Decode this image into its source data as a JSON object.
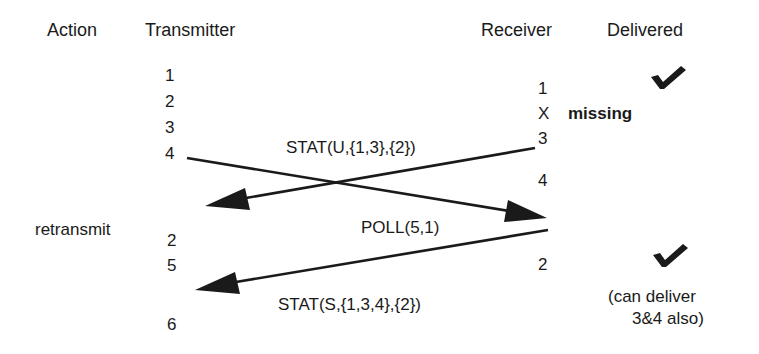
{
  "headers": {
    "action": "Action",
    "transmitter": "Transmitter",
    "receiver": "Receiver",
    "delivered": "Delivered"
  },
  "transmitter_seq": [
    "1",
    "2",
    "3",
    "4",
    "2",
    "5",
    "6"
  ],
  "receiver_seq": [
    "1",
    "X",
    "3",
    "4",
    "2"
  ],
  "action_label": "retransmit",
  "missing_label": "missing",
  "messages": {
    "stat_u": "STAT(U,{1,3},{2})",
    "poll": "POLL(5,1)",
    "stat_s": "STAT(S,{1,3,4},{2})"
  },
  "delivered_note": {
    "line1": "(can deliver",
    "line2": "3&4 also)"
  },
  "icons": [
    "checkmark-icon",
    "checkmark-icon"
  ],
  "colors": {
    "ink": "#1a1a1a",
    "background": "#ffffff"
  }
}
